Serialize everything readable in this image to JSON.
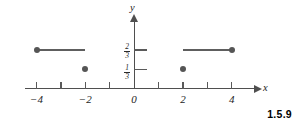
{
  "caption": "1.5.9",
  "chart_data": {
    "type": "scatter",
    "title": "",
    "xlabel": "x",
    "ylabel": "y",
    "xlim": [
      -4.5,
      4.9
    ],
    "ylim": [
      -0.12,
      1.2
    ],
    "grid": false,
    "legend": null,
    "x_ticks": [
      -4,
      -3,
      -2,
      -1,
      1,
      2,
      3,
      4
    ],
    "x_tick_labels": [
      {
        "value": -4,
        "label": "−4"
      },
      {
        "value": -2,
        "label": "−2"
      },
      {
        "value": 0,
        "label": "0"
      },
      {
        "value": 2,
        "label": "2"
      },
      {
        "value": 4,
        "label": "4"
      }
    ],
    "y_ticks": [
      0.3333,
      0.6667
    ],
    "y_tick_labels": [
      {
        "value": 0.6667,
        "numerator": "2",
        "denominator": "3"
      },
      {
        "value": 0.3333,
        "numerator": "1",
        "denominator": "3"
      }
    ],
    "segments": [
      {
        "name": "left-segment",
        "x_start": -4,
        "x_end": -2,
        "y": 0.6667,
        "start_endpoint": "closed",
        "end_endpoint": "none"
      },
      {
        "name": "right-segment",
        "x_start": 2,
        "x_end": 4,
        "y": 0.6667,
        "start_endpoint": "none",
        "end_endpoint": "closed"
      }
    ],
    "points": [
      {
        "name": "point-neg4",
        "x": -4,
        "y": 0.6667,
        "style": "filled"
      },
      {
        "name": "point-neg2-low",
        "x": -2,
        "y": 0.3333,
        "style": "filled"
      },
      {
        "name": "point-pos2-low",
        "x": 2,
        "y": 0.3333,
        "style": "filled"
      },
      {
        "name": "point-pos4",
        "x": 4,
        "y": 0.6667,
        "style": "filled"
      }
    ],
    "colors": {
      "axis": "#4f4f4f",
      "data": "#555555",
      "text": "#1d1d1d",
      "caption": "#000000",
      "background": "#ffffff"
    }
  }
}
